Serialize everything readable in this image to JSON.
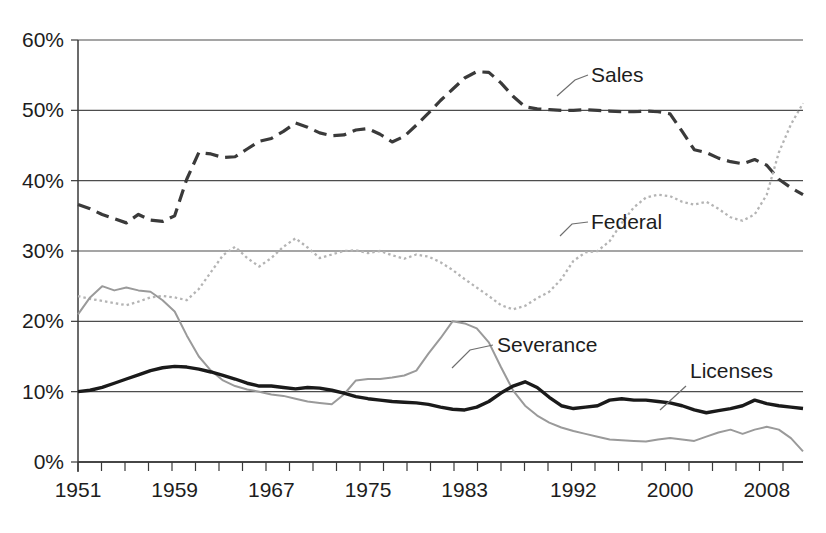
{
  "chart_data": {
    "type": "line",
    "title": "",
    "subtitle": "",
    "xlabel": "",
    "ylabel": "",
    "xlim": [
      1951,
      2011
    ],
    "ylim": [
      0,
      60
    ],
    "y_tick_labels": [
      "0%",
      "10%",
      "20%",
      "30%",
      "40%",
      "50%",
      "60%"
    ],
    "y_tick_values": [
      0,
      10,
      20,
      30,
      40,
      50,
      60
    ],
    "x_tick_labels": [
      "1951",
      "1959",
      "1967",
      "1975",
      "1983",
      "1992",
      "2000",
      "2008"
    ],
    "x_tick_values": [
      1951,
      1959,
      1967,
      1975,
      1983,
      1992,
      2000,
      2008
    ],
    "grid": "horizontal",
    "legend_position": "inline-annotations",
    "x": [
      1951,
      1952,
      1953,
      1954,
      1955,
      1956,
      1957,
      1958,
      1959,
      1960,
      1961,
      1962,
      1963,
      1964,
      1965,
      1966,
      1967,
      1968,
      1969,
      1970,
      1971,
      1972,
      1973,
      1974,
      1975,
      1976,
      1977,
      1978,
      1979,
      1980,
      1981,
      1982,
      1983,
      1984,
      1985,
      1986,
      1987,
      1988,
      1989,
      1990,
      1991,
      1992,
      1993,
      1994,
      1995,
      1996,
      1997,
      1998,
      1999,
      2000,
      2001,
      2002,
      2003,
      2004,
      2005,
      2006,
      2007,
      2008,
      2009,
      2010,
      2011
    ],
    "series": [
      {
        "name": "Sales",
        "style": "dashed",
        "color": "#3a3a3a",
        "width": 3.2,
        "values": [
          36.6,
          36.0,
          35.2,
          34.6,
          34.0,
          35.2,
          34.4,
          34.2,
          35.0,
          40.2,
          44.0,
          43.8,
          43.3,
          43.4,
          44.5,
          45.6,
          46.0,
          47.0,
          48.2,
          47.6,
          46.8,
          46.4,
          46.5,
          47.2,
          47.4,
          46.6,
          45.5,
          46.3,
          47.9,
          49.6,
          51.4,
          53.0,
          54.6,
          55.5,
          55.4,
          53.9,
          52.0,
          50.5,
          50.2,
          50.1,
          50.0,
          50.0,
          50.1,
          50.0,
          49.9,
          49.8,
          49.8,
          49.9,
          49.8,
          49.5,
          47.0,
          44.4,
          44.0,
          43.2,
          42.7,
          42.4,
          43.0,
          42.2,
          40.2,
          39.0,
          38.0
        ]
      },
      {
        "name": "Federal",
        "style": "dotted",
        "color": "#b4b4b4",
        "width": 2.3,
        "values": [
          23.6,
          23.2,
          22.9,
          22.6,
          22.3,
          22.8,
          23.4,
          23.6,
          23.4,
          23.0,
          24.6,
          27.0,
          29.4,
          30.6,
          29.0,
          27.8,
          29.0,
          30.6,
          31.8,
          30.5,
          29.0,
          29.5,
          30.0,
          30.1,
          29.7,
          30.0,
          29.4,
          28.9,
          29.5,
          29.2,
          28.4,
          27.3,
          26.0,
          24.8,
          23.6,
          22.3,
          21.7,
          22.2,
          23.3,
          24.2,
          26.0,
          28.6,
          29.8,
          30.0,
          31.4,
          34.0,
          36.2,
          37.6,
          38.0,
          37.8,
          37.0,
          36.6,
          37.0,
          36.0,
          34.8,
          34.3,
          35.2,
          38.0,
          44.0,
          48.0,
          51.0
        ]
      },
      {
        "name": "Severance",
        "style": "solid",
        "color": "#9a9a9a",
        "width": 2.0,
        "values": [
          21.0,
          23.4,
          25.0,
          24.4,
          24.8,
          24.4,
          24.2,
          23.0,
          21.4,
          18.0,
          15.0,
          13.0,
          11.6,
          10.8,
          10.3,
          10.0,
          9.6,
          9.4,
          9.0,
          8.6,
          8.4,
          8.2,
          9.6,
          11.6,
          11.8,
          11.8,
          12.0,
          12.3,
          13.0,
          15.4,
          17.6,
          20.0,
          19.7,
          19.0,
          17.0,
          13.5,
          10.2,
          8.0,
          6.6,
          5.6,
          4.9,
          4.4,
          4.0,
          3.6,
          3.2,
          3.1,
          3.0,
          2.9,
          3.2,
          3.4,
          3.2,
          3.0,
          3.6,
          4.2,
          4.6,
          4.0,
          4.6,
          5.0,
          4.6,
          3.4,
          1.5
        ]
      },
      {
        "name": "Licenses",
        "style": "solid",
        "color": "#1a1a1a",
        "width": 3.4,
        "values": [
          10.0,
          10.2,
          10.6,
          11.2,
          11.8,
          12.4,
          13.0,
          13.4,
          13.6,
          13.5,
          13.2,
          12.8,
          12.3,
          11.8,
          11.2,
          10.8,
          10.8,
          10.6,
          10.4,
          10.6,
          10.5,
          10.2,
          9.8,
          9.3,
          9.0,
          8.8,
          8.6,
          8.5,
          8.4,
          8.2,
          7.8,
          7.5,
          7.4,
          7.8,
          8.6,
          9.8,
          10.8,
          11.4,
          10.6,
          9.2,
          8.0,
          7.6,
          7.8,
          8.0,
          8.8,
          9.0,
          8.8,
          8.8,
          8.6,
          8.4,
          8.0,
          7.4,
          7.0,
          7.3,
          7.6,
          8.0,
          8.8,
          8.3,
          8.0,
          7.8,
          7.6
        ]
      }
    ],
    "annotations": [
      {
        "text": "Sales",
        "x_px": 591,
        "y_px": 82
      },
      {
        "text": "Federal",
        "x_px": 591,
        "y_px": 229
      },
      {
        "text": "Severance",
        "x_px": 497,
        "y_px": 352
      },
      {
        "text": "Licenses",
        "x_px": 690,
        "y_px": 378
      }
    ]
  }
}
